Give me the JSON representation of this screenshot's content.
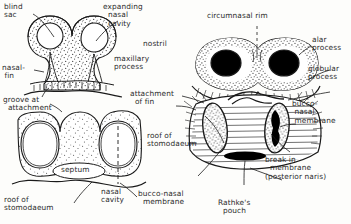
{
  "figure": {
    "kind": "anatomical-line-diagram",
    "panels": [
      {
        "id": "upper-left",
        "description": "transverse section through paired nasal sacs showing blind sac, expanding nasal cavity, nasal fin and groove at attachment"
      },
      {
        "id": "lower-left",
        "description": "later transverse section showing nasal cavities separated by septum over roof of stomodaeum"
      },
      {
        "id": "right",
        "description": "ventral view of the face showing nostrils, circumnasal rim, alar and globular processes, bucco-nasal membrane and Rathke's pouch"
      }
    ]
  },
  "labels": {
    "blind_sac": "blind\nsac",
    "expanding_nasal_cavity": "expanding\n  nasal\n  cavity",
    "nasal_fin": "nasal-\n fin",
    "groove_at_attachment": "groove at\n  attachment",
    "nostril": "nostril",
    "maxillary_process": "maxillary\nprocess",
    "circumnasal_rim": "circumnasal rim",
    "alar_process": "alar\nprocess",
    "globular_process": "globular\nprocess",
    "attachment_of_fin": "attachment\n  of fin",
    "bucco_nasal_membrane_right": "bucco-\n nasal\n membrane",
    "break_in_membrane": "break in\n  membrane\n(posterior naris)",
    "roof_of_stomodaeum_right": "roof of\nstomodaeum",
    "septum": "septum",
    "nasal_cavity": "nasal\ncavity",
    "roof_of_stomodaeum_left": "roof of\nstomodaeum",
    "bucco_nasal_membrane_center": "bucco-nasal\n  membrane",
    "rathkes_pouch": "Rathke's\n  pouch"
  },
  "colors": {
    "ink": "#1a1a1a",
    "label_text": "#2b2b2b",
    "paper": "#fdfdfb",
    "stipple": "#3a3a3a",
    "fill_dark": "#000000"
  }
}
